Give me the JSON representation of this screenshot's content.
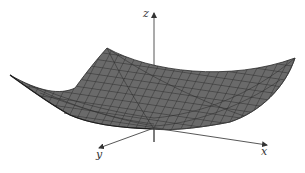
{
  "figure": {
    "type": "3d-surface",
    "surface_color": "#6e6e6e",
    "mesh_color": "#2a2a2a",
    "axis_color": "#444444",
    "axes": {
      "x": {
        "label": "x"
      },
      "y": {
        "label": "y"
      },
      "z": {
        "label": "z"
      }
    }
  }
}
